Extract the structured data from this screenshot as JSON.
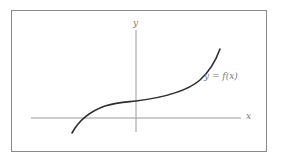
{
  "figure": {
    "x_axis_label": "x",
    "y_axis_label": "y",
    "curve_label": "y = f(x)",
    "colors": {
      "frame": "#8a8a8a",
      "axes": "#9a9a9a",
      "curve": "#2e2e2e",
      "labels": "#7a7a7a"
    }
  }
}
